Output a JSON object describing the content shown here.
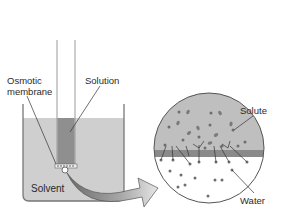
{
  "diagram": {
    "labels": {
      "osmotic_line1": "Osmotic",
      "osmotic_line2": "membrane",
      "solution": "Solution",
      "solvent": "Solvent",
      "solute": "Solute",
      "water": "Water"
    },
    "colors": {
      "solvent_fill": "#c9c9c9",
      "solution_fill": "#8f8f8f",
      "membrane_band": "#8a8a8a",
      "solute_region": "#bdbdbd",
      "water_region": "#ffffff",
      "particle": "#6e6e6e",
      "outline": "#555555"
    },
    "magnified_view": {
      "shape": "circle",
      "center": [
        209,
        148
      ],
      "radius": 55,
      "upper_region": "solute",
      "lower_region": "water"
    }
  }
}
